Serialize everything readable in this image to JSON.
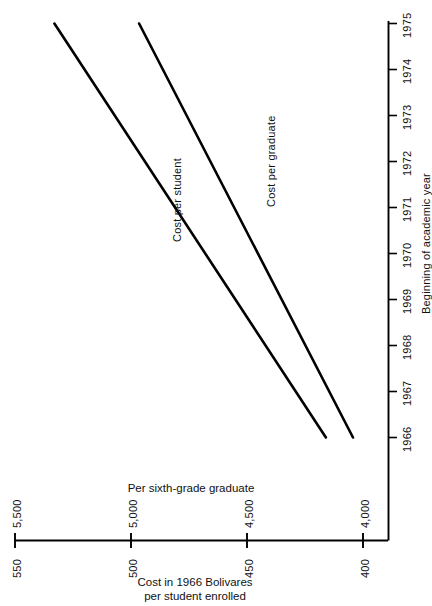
{
  "chart_data": {
    "type": "line",
    "title": "",
    "orientation": "rotated-90-ccw",
    "xlabel": "Beginning of academic year",
    "x_tick_labels": [
      "1966",
      "1967",
      "1968",
      "1969",
      "1970",
      "1971",
      "1972",
      "1973",
      "1974",
      "1975"
    ],
    "x": [
      1966,
      1967,
      1968,
      1969,
      1970,
      1971,
      1972,
      1973,
      1974,
      1975
    ],
    "xlim": [
      1966,
      1975
    ],
    "ylabel": "Cost in 1966 Bolivares\nper student enrolled",
    "ylabel_line1": "Cost in 1966 Bolivares",
    "ylabel_line2": "per student enrolled",
    "y_tick_labels": [
      "550",
      "500",
      "450",
      "400"
    ],
    "y_ticks": [
      550,
      500,
      450,
      400
    ],
    "ylim": [
      400,
      550
    ],
    "secondary_axis_title": "Per sixth-grade graduate",
    "secondary_y_tick_labels": [
      "5,500",
      "5,000",
      "4,500",
      "4,000"
    ],
    "secondary_y_ticks": [
      5500,
      5000,
      4500,
      4000
    ],
    "grid": false,
    "legend": "inline-labels",
    "series": [
      {
        "name": "Cost per student",
        "label": "Cost per student",
        "axis": "primary",
        "x": [
          1966,
          1975
        ],
        "values": [
          416,
          533
        ]
      },
      {
        "name": "Cost per graduate",
        "label": "Cost per graduate",
        "axis": "secondary",
        "x": [
          1966,
          1975
        ],
        "values": [
          4043,
          4965
        ]
      }
    ],
    "annotations": [],
    "colors": {
      "line": "#000000",
      "axis": "#000000",
      "background": "#ffffff",
      "text": "#111111"
    }
  },
  "axes": {
    "value_axis": {
      "title_line1": "Cost in 1966 Bolivares",
      "title_line2": "per student enrolled",
      "secondary_title": "Per sixth-grade graduate",
      "ticks": [
        {
          "primary": "550",
          "secondary": "5,500"
        },
        {
          "primary": "500",
          "secondary": "5,000"
        },
        {
          "primary": "450",
          "secondary": "4,500"
        },
        {
          "primary": "400",
          "secondary": "4,000"
        }
      ]
    },
    "time_axis": {
      "title": "Beginning of academic year",
      "ticks": [
        "1966",
        "1967",
        "1968",
        "1969",
        "1970",
        "1971",
        "1972",
        "1973",
        "1974",
        "1975"
      ]
    }
  },
  "series_labels": {
    "student": "Cost per student",
    "graduate": "Cost per graduate"
  }
}
